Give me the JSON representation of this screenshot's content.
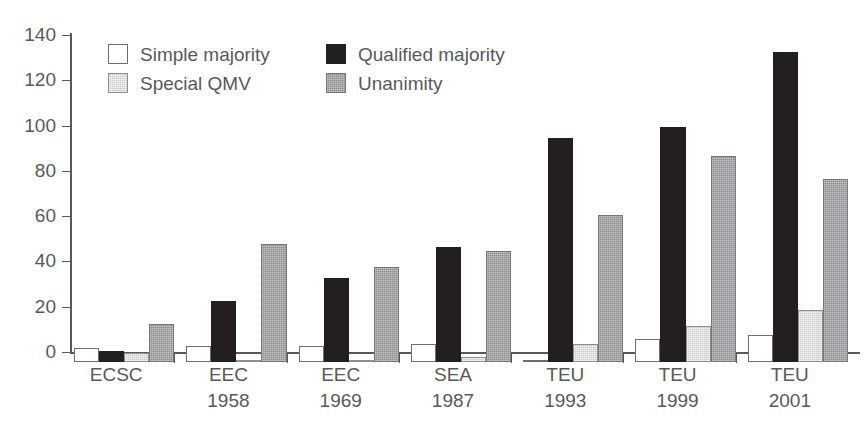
{
  "chart_data": {
    "type": "bar",
    "title": "",
    "xlabel": "",
    "ylabel": "",
    "ylim": [
      0,
      140
    ],
    "ytick_step": 20,
    "yticks": [
      0,
      20,
      40,
      60,
      80,
      100,
      120,
      140
    ],
    "grid": false,
    "legend_position": "top-left-inside",
    "categories": [
      "ECSC",
      "EEC 1958",
      "EEC 1969",
      "SEA 1987",
      "TEU 1993",
      "TEU 1999",
      "TEU 2001"
    ],
    "category_lines": [
      {
        "line1": "ECSC",
        "line2": ""
      },
      {
        "line1": "EEC",
        "line2": "1958"
      },
      {
        "line1": "EEC",
        "line2": "1969"
      },
      {
        "line1": "SEA",
        "line2": "1987"
      },
      {
        "line1": "TEU",
        "line2": "1993"
      },
      {
        "line1": "TEU",
        "line2": "1999"
      },
      {
        "line1": "TEU",
        "line2": "2001"
      }
    ],
    "series": [
      {
        "name": "Simple majority",
        "key": "simple",
        "color": "#ffffff",
        "values": [
          6,
          7,
          7,
          8,
          1,
          10,
          12
        ]
      },
      {
        "name": "Qualified majority",
        "key": "qualified",
        "color": "#231f20",
        "values": [
          5,
          27,
          37,
          51,
          99,
          104,
          137
        ]
      },
      {
        "name": "Special QMV",
        "key": "special",
        "color": "#c9c9c9",
        "values": [
          4,
          1,
          1,
          2,
          8,
          16,
          23
        ]
      },
      {
        "name": "Unanimity",
        "key": "unanimity",
        "color": "#8c8d8f",
        "values": [
          17,
          52,
          42,
          49,
          65,
          91,
          81
        ]
      }
    ]
  },
  "legend": {
    "items": [
      {
        "label": "Simple majority",
        "swatch": "sw-simple"
      },
      {
        "label": "Qualified majority",
        "swatch": "sw-qualified"
      },
      {
        "label": "Special QMV",
        "swatch": "sw-special"
      },
      {
        "label": "Unanimity",
        "swatch": "sw-unanimity"
      }
    ],
    "order": [
      0,
      1,
      2,
      3
    ]
  },
  "colors": {
    "axis": "#58595b",
    "text": "#58595b",
    "background": "#ffffff"
  }
}
